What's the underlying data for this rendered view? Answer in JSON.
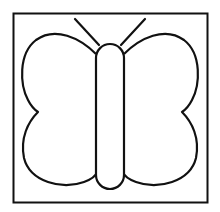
{
  "image": {
    "subject": "butterfly outline coloring page",
    "width": 220,
    "height": 212,
    "colors": {
      "background": "#ffffff",
      "stroke": "#111111"
    }
  }
}
